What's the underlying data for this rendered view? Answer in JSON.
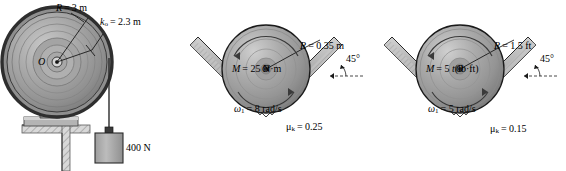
{
  "figure": {
    "kind": "engineering-mechanics-problem-figure",
    "panels": [
      {
        "id": "a",
        "type": "drum-pulley-on-post-with-hanging-weight",
        "center_label": "O",
        "labels": {
          "radius": "R = 3 m",
          "radius_symbol": "R",
          "radius_value": "3 m",
          "gyration": "k",
          "gyration_sub": "o",
          "gyration_value": "= 2.3 m",
          "weight": "400 N"
        }
      },
      {
        "id": "b",
        "type": "cylinder-in-v-groove",
        "center_label": "O",
        "labels": {
          "radius_symbol": "R",
          "radius_value": "= 0.35 m",
          "moment_symbol": "M",
          "moment_value": "= 25 N·m",
          "omega_symbol": "ω",
          "omega_sub": "1",
          "omega_value": "= 8 rad/s",
          "mu_symbol": "μ",
          "mu_sub": "k",
          "mu_value": "= 0.25",
          "angle": "45°"
        }
      },
      {
        "id": "c",
        "type": "cylinder-in-v-groove",
        "center_label": "O",
        "labels": {
          "radius_symbol": "R",
          "radius_value": "= 1.5 ft",
          "moment_symbol": "M",
          "moment_value": "= 5 ",
          "moment_var": "t",
          "moment_units": "(lb·ft)",
          "omega_symbol": "ω",
          "omega_sub": "1",
          "omega_value": "= 5 rad/s",
          "mu_symbol": "μ",
          "mu_sub": "k",
          "mu_value": "= 0.15",
          "angle": "45°"
        }
      }
    ],
    "colors": {
      "background": "#ffffff",
      "body_gray": "#9a9a9a",
      "body_gray_dark": "#6f6f6f",
      "body_gray_light": "#c2c2c2",
      "rim_dark": "#2e2e2e",
      "outline": "#1a1a1a",
      "hatch": "#8d8d8d"
    }
  }
}
